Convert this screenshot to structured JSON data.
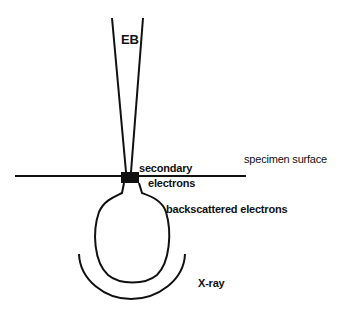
{
  "diagram": {
    "type": "electron beam interaction schematic",
    "labels": {
      "beam": "EB",
      "secondary_line1": "secondary",
      "secondary_line2": "electrons",
      "surface": "specimen surface",
      "backscattered": "backscattered electrons",
      "xray": "X-ray"
    },
    "colors": {
      "ink": "#111111",
      "background": "#ffffff"
    }
  }
}
